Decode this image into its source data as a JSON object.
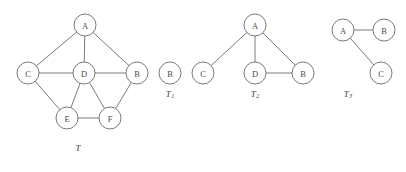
{
  "figure": {
    "width": 406,
    "height": 172,
    "stroke_color": "#6b6b6b",
    "node_fill": "#ffffff",
    "label_color": "#4a4a4a",
    "node_radius": 11
  },
  "graphs": [
    {
      "id": "T",
      "caption": "T",
      "caption_sub": "",
      "caption_x": 78,
      "caption_y": 148,
      "nodes": [
        {
          "label": "A",
          "x": 85,
          "y": 25
        },
        {
          "label": "C",
          "x": 28,
          "y": 73
        },
        {
          "label": "D",
          "x": 84,
          "y": 73
        },
        {
          "label": "B",
          "x": 137,
          "y": 73
        },
        {
          "label": "E",
          "x": 67,
          "y": 118
        },
        {
          "label": "F",
          "x": 110,
          "y": 118
        }
      ],
      "edges": [
        {
          "from": "A",
          "to": "C"
        },
        {
          "from": "A",
          "to": "D"
        },
        {
          "from": "A",
          "to": "B"
        },
        {
          "from": "C",
          "to": "D"
        },
        {
          "from": "D",
          "to": "B"
        },
        {
          "from": "C",
          "to": "E"
        },
        {
          "from": "D",
          "to": "E"
        },
        {
          "from": "D",
          "to": "F"
        },
        {
          "from": "B",
          "to": "F"
        },
        {
          "from": "E",
          "to": "F"
        }
      ]
    },
    {
      "id": "T1",
      "caption": "T",
      "caption_sub": "1",
      "caption_x": 170,
      "caption_y": 94,
      "nodes": [
        {
          "label": "B",
          "x": 170,
          "y": 73
        }
      ],
      "edges": []
    },
    {
      "id": "T2",
      "caption": "T",
      "caption_sub": "2",
      "caption_x": 255,
      "caption_y": 94,
      "nodes": [
        {
          "label": "A",
          "x": 255,
          "y": 25
        },
        {
          "label": "C",
          "x": 203,
          "y": 73
        },
        {
          "label": "D",
          "x": 255,
          "y": 73
        },
        {
          "label": "B",
          "x": 303,
          "y": 73
        }
      ],
      "edges": [
        {
          "from": "A",
          "to": "C"
        },
        {
          "from": "A",
          "to": "D"
        },
        {
          "from": "A",
          "to": "B"
        },
        {
          "from": "D",
          "to": "B"
        }
      ]
    },
    {
      "id": "T3",
      "caption": "T",
      "caption_sub": "3",
      "caption_x": 348,
      "caption_y": 94,
      "nodes": [
        {
          "label": "A",
          "x": 343,
          "y": 30
        },
        {
          "label": "B",
          "x": 384,
          "y": 30
        },
        {
          "label": "C",
          "x": 381,
          "y": 73
        }
      ],
      "edges": [
        {
          "from": "A",
          "to": "B"
        },
        {
          "from": "A",
          "to": "C"
        }
      ]
    }
  ]
}
